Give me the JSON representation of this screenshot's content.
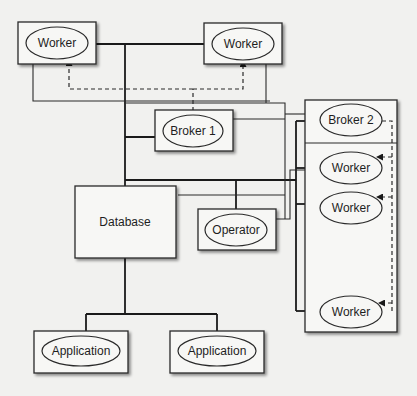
{
  "diagram": {
    "type": "system-architecture",
    "nodes": {
      "worker_top_left": {
        "label": "Worker",
        "shape": "ellipse-in-box"
      },
      "worker_top_right": {
        "label": "Worker",
        "shape": "ellipse-in-box"
      },
      "broker_1": {
        "label": "Broker 1",
        "shape": "ellipse-in-box"
      },
      "broker_2": {
        "label": "Broker 2",
        "shape": "ellipse"
      },
      "worker_right_1": {
        "label": "Worker",
        "shape": "ellipse"
      },
      "worker_right_2": {
        "label": "Worker",
        "shape": "ellipse"
      },
      "worker_right_3": {
        "label": "Worker",
        "shape": "ellipse"
      },
      "database": {
        "label": "Database",
        "shape": "box"
      },
      "operator": {
        "label": "Operator",
        "shape": "ellipse-in-box"
      },
      "application_left": {
        "label": "Application",
        "shape": "ellipse-in-box"
      },
      "application_right": {
        "label": "Application",
        "shape": "ellipse-in-box"
      }
    },
    "edges": [
      {
        "from": "worker_top_left",
        "to": "worker_top_right",
        "style": "solid"
      },
      {
        "from": "worker_top_left",
        "to": "database",
        "style": "solid"
      },
      {
        "from": "broker_1",
        "to": "database",
        "style": "solid"
      },
      {
        "from": "broker_1",
        "to": "worker_top_left",
        "style": "dashed-arrow"
      },
      {
        "from": "broker_1",
        "to": "worker_top_right",
        "style": "dashed-arrow"
      },
      {
        "from": "broker_2",
        "to": "worker_right_1",
        "style": "dashed-arrow"
      },
      {
        "from": "broker_2",
        "to": "worker_right_2",
        "style": "dashed-arrow"
      },
      {
        "from": "broker_2",
        "to": "worker_right_3",
        "style": "dashed-arrow"
      },
      {
        "from": "operator",
        "to": "database",
        "style": "solid"
      },
      {
        "from": "database",
        "to": "application_left",
        "style": "solid"
      },
      {
        "from": "database",
        "to": "application_right",
        "style": "solid"
      }
    ]
  }
}
